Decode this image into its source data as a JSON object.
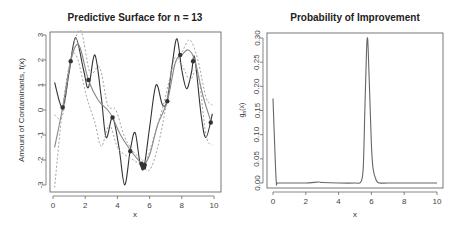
{
  "chart_data": [
    {
      "type": "line",
      "title": "Predictive Surface for n = 13",
      "xlabel": "x",
      "ylabel": "Amount of Contaminants, f(x)",
      "xlim": [
        0,
        10
      ],
      "ylim": [
        -3,
        3
      ],
      "xticks": [
        "0",
        "2",
        "4",
        "6",
        "8",
        "10"
      ],
      "yticks": [
        "-3",
        "-2",
        "-1",
        "0",
        "1",
        "2",
        "3"
      ],
      "grid": false,
      "series": [
        {
          "name": "true function",
          "style": "solid dark",
          "x": [
            0.1,
            0.6,
            1.0,
            1.4,
            1.9,
            2.2,
            2.6,
            3.0,
            3.3,
            3.7,
            4.1,
            4.45,
            4.8,
            5.1,
            5.4,
            5.65,
            6.0,
            6.4,
            6.8,
            7.1,
            7.4,
            7.7,
            8.0,
            8.3,
            8.6,
            8.8,
            9.2,
            9.5,
            9.9
          ],
          "y": [
            1.1,
            0.1,
            1.5,
            2.9,
            1.6,
            0.9,
            2.2,
            0.5,
            -1.1,
            -0.3,
            -1.5,
            -3.0,
            -1.6,
            -0.9,
            -2.1,
            -2.3,
            -0.7,
            1.0,
            0.2,
            0.4,
            1.8,
            2.85,
            1.6,
            0.85,
            1.5,
            2.1,
            -0.2,
            -1.1,
            -0.15
          ]
        },
        {
          "name": "predictive mean",
          "style": "solid grey",
          "x": [
            0.1,
            0.6,
            1.1,
            1.6,
            2.2,
            2.8,
            3.4,
            3.7,
            4.2,
            4.8,
            5.3,
            5.6,
            6.0,
            6.5,
            7.1,
            7.6,
            8.0,
            8.4,
            8.8,
            9.3,
            9.8
          ],
          "y": [
            -1.5,
            0.1,
            1.95,
            2.6,
            1.2,
            0.4,
            0.0,
            -0.3,
            -1.0,
            -1.6,
            -2.0,
            -2.2,
            -1.8,
            -0.6,
            0.35,
            1.9,
            2.2,
            2.4,
            2.0,
            0.6,
            -0.45
          ]
        },
        {
          "name": "upper bound",
          "style": "dashed",
          "x": [
            0.1,
            0.6,
            1.1,
            1.7,
            2.3,
            2.9,
            3.4,
            3.9,
            4.4,
            4.9,
            5.4,
            5.8,
            6.3,
            6.9,
            7.4,
            8.0,
            8.5,
            9.0,
            9.5,
            9.9
          ],
          "y": [
            -0.2,
            -0.2,
            2.0,
            3.2,
            1.5,
            1.7,
            0.2,
            0.0,
            -1.0,
            -1.6,
            -1.9,
            -2.0,
            -1.0,
            0.3,
            1.6,
            2.3,
            2.8,
            2.0,
            0.5,
            0.2
          ]
        },
        {
          "name": "lower bound",
          "style": "dashed",
          "x": [
            0.1,
            0.6,
            1.1,
            1.5,
            2.1,
            2.6,
            3.0,
            3.5,
            4.0,
            4.5,
            5.0,
            5.5,
            6.0,
            6.5,
            7.0,
            7.5,
            8.0,
            8.5,
            9.0,
            9.5,
            9.9
          ],
          "y": [
            -3.1,
            0.1,
            2.0,
            2.1,
            0.5,
            -0.5,
            -1.45,
            -0.6,
            -1.5,
            -1.8,
            -2.0,
            -2.2,
            -2.4,
            -1.5,
            0.1,
            2.0,
            1.8,
            1.2,
            1.5,
            -1.0,
            -1.4
          ]
        }
      ],
      "points": {
        "name": "observations (n = 13)",
        "x": [
          0.6,
          1.1,
          2.2,
          3.7,
          4.8,
          5.5,
          5.6,
          5.65,
          5.7,
          7.1,
          7.9,
          8.7,
          9.8
        ],
        "y": [
          0.1,
          1.95,
          1.2,
          -0.3,
          -1.65,
          -2.15,
          -2.25,
          -2.3,
          -2.2,
          0.35,
          2.2,
          1.95,
          -0.5
        ]
      }
    },
    {
      "type": "line",
      "title": "Probability of Improvement",
      "xlabel": "x",
      "ylabel": "g_n(x)",
      "xlim": [
        0,
        10
      ],
      "ylim": [
        0,
        0.3
      ],
      "xticks": [
        "0",
        "2",
        "4",
        "6",
        "8",
        "10"
      ],
      "yticks": [
        "0.00",
        "0.05",
        "0.10",
        "0.15",
        "0.20",
        "0.25",
        "0.30"
      ],
      "grid": false,
      "series": [
        {
          "name": "probability of improvement",
          "x": [
            0.0,
            0.1,
            0.2,
            0.3,
            1.0,
            2.0,
            2.8,
            3.0,
            4.0,
            5.0,
            5.35,
            5.5,
            5.6,
            5.7,
            5.75,
            5.8,
            5.9,
            6.0,
            6.1,
            6.3,
            6.5,
            7.0,
            8.0,
            9.0,
            10.0
          ],
          "y": [
            0.175,
            0.08,
            0.002,
            0.0,
            0.0,
            0.0,
            0.002,
            0.001,
            0.0,
            0.0,
            0.002,
            0.03,
            0.15,
            0.27,
            0.3,
            0.28,
            0.18,
            0.08,
            0.03,
            0.005,
            0.0,
            0.0,
            0.0,
            0.0,
            0.0
          ]
        }
      ]
    }
  ]
}
